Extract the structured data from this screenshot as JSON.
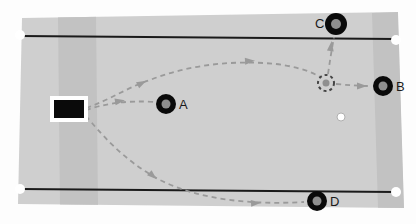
{
  "scene": {
    "title": "robot trajectory field diagram",
    "width": 416,
    "height": 224,
    "background_color": "#fdfdfd",
    "field_color": "#cfcfcf",
    "field_shade_color": "#c2c2c2",
    "line_color": "#1a1a1a",
    "path_color": "#9a9a9a",
    "marker_color": "#0a0a0a",
    "marker_center_color": "#8f8f8f",
    "endpoint_dot_color": "#ffffff"
  },
  "field": {
    "name": "playing-field",
    "corners": "22,18 398,12 404,208 18,204",
    "shade_band_left": "58,16 96,15 98,206 60,206",
    "shade_band_right": "372,13 398,12 404,208 378,208"
  },
  "boundary_lines": [
    {
      "name": "top-boundary-line",
      "x1": 20,
      "y1": 36,
      "x2": 396,
      "y2": 39,
      "left_dot": {
        "cx": 20,
        "cy": 35,
        "r": 5
      },
      "right_dot": {
        "cx": 396,
        "cy": 40,
        "r": 5
      }
    },
    {
      "name": "bottom-boundary-line",
      "x1": 20,
      "y1": 189,
      "x2": 396,
      "y2": 192,
      "left_dot": {
        "cx": 20,
        "cy": 189,
        "r": 5
      },
      "right_dot": {
        "cx": 396,
        "cy": 192,
        "r": 5
      }
    }
  ],
  "origin_marker": {
    "name": "origin-rectangle",
    "x": 54,
    "y": 100,
    "width": 30,
    "height": 18,
    "fill": "#0a0a0a",
    "border_color": "#ffffff",
    "border_width": 4
  },
  "markers": [
    {
      "id": "A",
      "label": "A",
      "cx": 166,
      "cy": 104,
      "r": 10,
      "inner_r": 4.5,
      "label_x": 179,
      "label_y": 98,
      "label_side": "right"
    },
    {
      "id": "B",
      "label": "B",
      "cx": 383,
      "cy": 86,
      "r": 10,
      "inner_r": 4.5,
      "label_x": 396,
      "label_y": 80,
      "label_side": "right"
    },
    {
      "id": "C",
      "label": "C",
      "cx": 336,
      "cy": 24,
      "r": 11,
      "inner_r": 5,
      "label_x": 315,
      "label_y": 17,
      "label_side": "left"
    },
    {
      "id": "D",
      "label": "D",
      "cx": 317,
      "cy": 201,
      "r": 10,
      "inner_r": 4.5,
      "label_x": 330,
      "label_y": 195,
      "label_side": "right"
    }
  ],
  "target_circle": {
    "name": "dashed-target-circle",
    "cx": 326,
    "cy": 83,
    "r": 8,
    "inner_r": 3.5,
    "stroke": "#444444",
    "dash": "3 3",
    "inner_fill": "#8f8f8f"
  },
  "small_dot": {
    "name": "small-white-dot",
    "cx": 341,
    "cy": 117,
    "r": 4,
    "fill": "#ffffff",
    "stroke": "#b0b0b0"
  },
  "paths": [
    {
      "name": "path-upper-arc-to-target",
      "d": "M 86 108 C 110 100 126 88 150 80 C 190 64 236 60 276 64 C 300 67 314 73 320 77",
      "arrows": [
        {
          "x": 142,
          "y": 83,
          "angle": -28
        },
        {
          "x": 250,
          "y": 61,
          "angle": -3
        }
      ]
    },
    {
      "name": "path-direct-to-marker-a",
      "d": "M 86 110 C 104 104 126 100 154 102",
      "arrows": [
        {
          "x": 120,
          "y": 101,
          "angle": -10
        }
      ]
    },
    {
      "name": "path-lower-arc-to-marker-d",
      "d": "M 86 116 C 98 130 122 160 160 180 C 200 200 252 205 304 202",
      "arrows": [
        {
          "x": 153,
          "y": 176,
          "angle": 42
        },
        {
          "x": 256,
          "y": 203,
          "angle": -4
        }
      ]
    },
    {
      "name": "path-target-to-marker-b",
      "d": "M 336 84 C 348 85 358 86 370 86",
      "arrows": [
        {
          "x": 362,
          "y": 86,
          "angle": 0
        }
      ]
    },
    {
      "name": "path-target-to-marker-c",
      "d": "M 328 74 C 330 60 332 48 334 37",
      "arrows": [
        {
          "x": 331,
          "y": 46,
          "angle": -82
        }
      ]
    }
  ]
}
